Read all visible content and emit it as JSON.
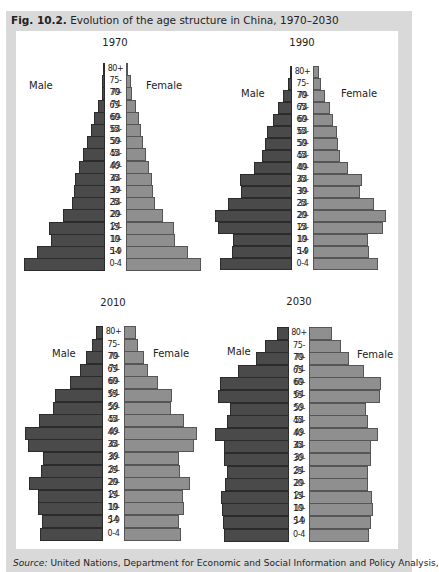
{
  "figure": {
    "label": "Fig. 10.2.",
    "title": "Evolution of the age structure in China, 1970–2030",
    "source_label": "Source:",
    "source_text": "United Nations, Department for Economic and Social Information and Policy Analysis,"
  },
  "labels": {
    "male": "Male",
    "female": "Female"
  },
  "colors": {
    "male": "#4a4a4a",
    "female": "#8f8f8f",
    "frame": "#d9d9d9"
  },
  "chart_data": [
    {
      "type": "bar",
      "subtype": "population-pyramid",
      "title": "1970",
      "categories": [
        "80+",
        "75-79",
        "70-74",
        "65-69",
        "60-64",
        "55-59",
        "50-54",
        "45-49",
        "40-44",
        "35-39",
        "30-34",
        "25-29",
        "20-24",
        "15-19",
        "10-14",
        "5-9",
        "0-4"
      ],
      "series": [
        {
          "name": "Male",
          "values": [
            2,
            3,
            3,
            7,
            11,
            14,
            18,
            22,
            26,
            30,
            31,
            33,
            42,
            56,
            54,
            68,
            81
          ]
        },
        {
          "name": "Female",
          "values": [
            2,
            5,
            6,
            10,
            13,
            15,
            17,
            20,
            23,
            26,
            27,
            29,
            37,
            48,
            49,
            62,
            75
          ]
        }
      ],
      "units": "relative bar length (px)",
      "xlabel": "",
      "ylabel": "Age group"
    },
    {
      "type": "bar",
      "subtype": "population-pyramid",
      "title": "1990",
      "categories": [
        "80+",
        "75-79",
        "70-74",
        "65-69",
        "60-64",
        "55-59",
        "50-54",
        "45-49",
        "40-44",
        "35-39",
        "30-34",
        "25-29",
        "20-24",
        "15-19",
        "10-14",
        "5-9",
        "0-4"
      ],
      "series": [
        {
          "name": "Male",
          "values": [
            2,
            4,
            9,
            14,
            19,
            25,
            27,
            30,
            38,
            52,
            51,
            64,
            77,
            74,
            59,
            60,
            72
          ]
        },
        {
          "name": "Female",
          "values": [
            6,
            8,
            12,
            17,
            20,
            24,
            25,
            27,
            35,
            49,
            47,
            61,
            73,
            70,
            55,
            56,
            65
          ]
        }
      ],
      "units": "relative bar length (px)",
      "xlabel": "",
      "ylabel": "Age group"
    },
    {
      "type": "bar",
      "subtype": "population-pyramid",
      "title": "2010",
      "categories": [
        "80+",
        "75-79",
        "70-74",
        "65-69",
        "60-64",
        "55-59",
        "50-54",
        "45-49",
        "40-44",
        "35-39",
        "30-34",
        "25-29",
        "20-24",
        "15-19",
        "10-14",
        "5-9",
        "0-4"
      ],
      "series": [
        {
          "name": "Male",
          "values": [
            7,
            11,
            17,
            23,
            33,
            48,
            50,
            64,
            78,
            75,
            60,
            62,
            74,
            65,
            65,
            61,
            63
          ]
        },
        {
          "name": "Female",
          "values": [
            12,
            14,
            20,
            24,
            34,
            48,
            47,
            60,
            73,
            70,
            55,
            56,
            66,
            59,
            60,
            55,
            57
          ]
        }
      ],
      "units": "relative bar length (px)",
      "xlabel": "",
      "ylabel": "Age group"
    },
    {
      "type": "bar",
      "subtype": "population-pyramid",
      "title": "2030",
      "categories": [
        "80+",
        "75-79",
        "70-74",
        "65-69",
        "60-64",
        "55-59",
        "50-54",
        "45-49",
        "40-44",
        "35-39",
        "30-34",
        "25-29",
        "20-24",
        "15-19",
        "10-14",
        "5-9",
        "0-4"
      ],
      "series": [
        {
          "name": "Male",
          "values": [
            12,
            24,
            33,
            51,
            69,
            71,
            59,
            62,
            74,
            65,
            65,
            62,
            64,
            68,
            67,
            66,
            65
          ]
        },
        {
          "name": "Female",
          "values": [
            23,
            32,
            40,
            55,
            72,
            71,
            57,
            59,
            69,
            62,
            62,
            59,
            59,
            63,
            64,
            62,
            60
          ]
        }
      ],
      "units": "relative bar length (px)",
      "xlabel": "",
      "ylabel": "Age group"
    }
  ]
}
